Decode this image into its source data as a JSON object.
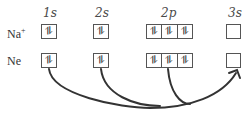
{
  "orbitals": [
    {
      "label": "1s",
      "x": 43
    },
    {
      "label": "2s",
      "x": 95
    },
    {
      "label": "2p",
      "x": 160
    },
    {
      "label": "3s",
      "x": 228
    }
  ],
  "rows": [
    {
      "species": "Na",
      "charge": "+",
      "1s": "⥮",
      "2s": "⥮",
      "2p": [
        "⥮",
        "⥮",
        "⥮"
      ],
      "3s": ""
    },
    {
      "species": "Ne",
      "charge": "",
      "1s": "⥮",
      "2s": "⥮",
      "2p": [
        "⥮",
        "⥮",
        "⥮"
      ],
      "3s": ""
    }
  ],
  "arrows": [
    {
      "from": "Ne 1s",
      "to": "Ne 3s"
    },
    {
      "from": "Ne 2s",
      "to": "Ne 3s"
    },
    {
      "from": "Ne 2p",
      "to": "Ne 3s"
    }
  ],
  "colors": {
    "line": "#333333",
    "box": "#555555"
  }
}
